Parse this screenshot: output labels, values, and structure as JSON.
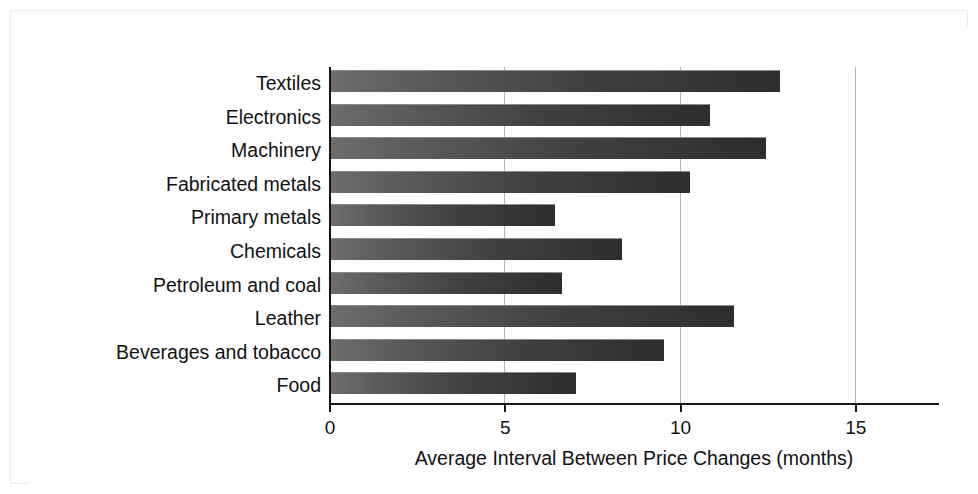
{
  "chart_data": {
    "type": "bar",
    "orientation": "horizontal",
    "title": "",
    "xlabel": "Average Interval Between Price Changes (months)",
    "ylabel": "",
    "categories": [
      "Textiles",
      "Electronics",
      "Machinery",
      "Fabricated metals",
      "Primary metals",
      "Chemicals",
      "Petroleum and coal",
      "Leather",
      "Beverages and tobacco",
      "Food"
    ],
    "values": [
      12.8,
      10.8,
      12.4,
      10.25,
      6.4,
      8.3,
      6.6,
      11.5,
      9.5,
      7.0
    ],
    "units": "months",
    "xlim": [
      0,
      17.4
    ],
    "xticks": [
      0,
      5,
      10,
      15
    ],
    "xtick_labels": [
      "0",
      "5",
      "10",
      "15"
    ],
    "grid": "vertical",
    "legend": "none",
    "bar_fill": "#414141",
    "axis_color": "#141414",
    "gridline_color": "#b4b4b4",
    "background": "#ffffff"
  }
}
